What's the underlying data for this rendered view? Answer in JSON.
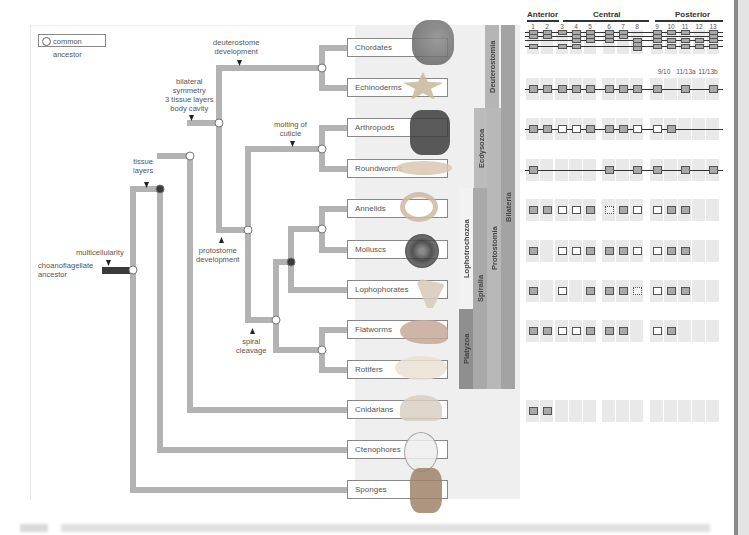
{
  "legend": {
    "label": "common ancestor",
    "icon": "open-circle-icon"
  },
  "ancestor": {
    "label": "choanoflagellate\nancestor",
    "trait": "multicellularity"
  },
  "traits": [
    {
      "id": "tissue",
      "label": "tissue\nlayers"
    },
    {
      "id": "bilateral",
      "label": "bilateral\nsymmetry\n3 tissue layers\nbody cavity"
    },
    {
      "id": "deuterostome",
      "label": "deuterostome\ndevelopment"
    },
    {
      "id": "protostome",
      "label": "protostome\ndevelopment"
    },
    {
      "id": "molting",
      "label": "molting of\ncuticle"
    },
    {
      "id": "spiral",
      "label": "spiral\ncleavage"
    }
  ],
  "taxa": [
    {
      "name": "Chordates",
      "organism": "eagle"
    },
    {
      "name": "Echinoderms",
      "organism": "sea-star"
    },
    {
      "name": "Arthropods",
      "organism": "lobster"
    },
    {
      "name": "Roundworms",
      "organism": "roundworm"
    },
    {
      "name": "Annelids",
      "organism": "earthworm"
    },
    {
      "name": "Molluscs",
      "organism": "snail"
    },
    {
      "name": "Lophophorates",
      "organism": "bryozoan"
    },
    {
      "name": "Flatworms",
      "organism": "flatworm"
    },
    {
      "name": "Rotifers",
      "organism": "rotifer"
    },
    {
      "name": "Cnidarians",
      "organism": "jellyfish"
    },
    {
      "name": "Ctenophores",
      "organism": "comb-jelly"
    },
    {
      "name": "Sponges",
      "organism": "sponge"
    }
  ],
  "clades": [
    {
      "name": "Deuterostomia",
      "color": "#b5b5b5"
    },
    {
      "name": "Ecdysozoa",
      "color": "#bcbcbc"
    },
    {
      "name": "Lophotrochozoa",
      "color": "#f2f2f2"
    },
    {
      "name": "Platyzoa",
      "color": "#8f8f8f"
    },
    {
      "name": "Spiralia",
      "color": "#a9a9a9"
    },
    {
      "name": "Protostomia",
      "color": "#b8b8b8"
    },
    {
      "name": "Bilateria",
      "color": "#a3a3a3"
    }
  ],
  "hox": {
    "regions": [
      "Anterior",
      "Central",
      "Posterior"
    ],
    "gene_numbers": [
      "1",
      "2",
      "3",
      "4",
      "5",
      "6",
      "7",
      "8",
      "9",
      "10",
      "11",
      "12",
      "13"
    ],
    "echinoderm_labels": [
      "9/10",
      "11/13a",
      "11/13b"
    ]
  },
  "colors": {
    "branch": "#b3b3b3",
    "node_open": "#ffffff",
    "node_filled": "#3c3c3c",
    "ancestor_bar": "#3a3a3a"
  }
}
